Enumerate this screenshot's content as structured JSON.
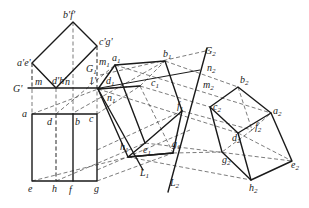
{
  "figure": {
    "front_view": {
      "labels": [
        "b'f'",
        "c'g'",
        "a'e'",
        "d'h'",
        "m",
        "n",
        "G'",
        "1'"
      ],
      "points": {
        "bf": [
          73,
          22
        ],
        "cg": [
          97,
          46
        ],
        "ae": [
          32,
          63
        ],
        "dh": [
          56,
          88
        ]
      }
    },
    "top_view": {
      "labels": [
        "a",
        "d",
        "b",
        "c",
        "e",
        "h",
        "f",
        "g"
      ],
      "points": {
        "a": [
          32,
          114
        ],
        "d": [
          56,
          114
        ],
        "b": [
          73,
          114
        ],
        "c": [
          97,
          114
        ],
        "e": [
          32,
          181
        ],
        "h": [
          56,
          181
        ],
        "f": [
          73,
          181
        ],
        "g": [
          97,
          181
        ]
      }
    },
    "aux_view_1": {
      "labels": [
        "a1",
        "b1",
        "c1",
        "d1",
        "e1",
        "f1",
        "g1",
        "h1",
        "m1",
        "n1",
        "G1",
        "L1"
      ],
      "points": {
        "a1": [
          115,
          65
        ],
        "b1": [
          165,
          61
        ],
        "c1": [
          140,
          86
        ],
        "d1": [
          98,
          89
        ],
        "e1": [
          145,
          143
        ],
        "f1": [
          182,
          111
        ],
        "g1": [
          173,
          153
        ],
        "h1": [
          128,
          157
        ]
      }
    },
    "aux_view_2": {
      "labels": [
        "a2",
        "b2",
        "c2",
        "d2",
        "e2",
        "f2",
        "g2",
        "h2",
        "m2",
        "n2",
        "G2",
        "L2"
      ],
      "points": {
        "a2": [
          271,
          113
        ],
        "b2": [
          238,
          87
        ],
        "c2": [
          210,
          107
        ],
        "d2": [
          238,
          133
        ],
        "e2": [
          292,
          161
        ],
        "f2": [
          252,
          130
        ],
        "g2": [
          222,
          152
        ],
        "h2": [
          251,
          180
        ]
      }
    },
    "axis_lines": {
      "G_prime": "G'",
      "G1": "G",
      "G2": "G",
      "L1": "L",
      "L2": "L"
    }
  },
  "text": {
    "bf": "b'f'",
    "cg": "c'g'",
    "ae": "a'e'",
    "dh": "d'h'",
    "m": "m",
    "n": "n",
    "Gp": "G'",
    "one": "1'",
    "a": "a",
    "b": "b",
    "c": "c",
    "d": "d",
    "e": "e",
    "f": "f",
    "g": "g",
    "h": "h",
    "G": "G",
    "L": "L",
    "m_": "m",
    "n_": "n",
    "a_": "a",
    "b_": "b",
    "c_": "c",
    "d_": "d",
    "e_": "e",
    "f_": "f",
    "g_": "g",
    "h_": "h",
    "s1": "1",
    "s2": "2"
  }
}
